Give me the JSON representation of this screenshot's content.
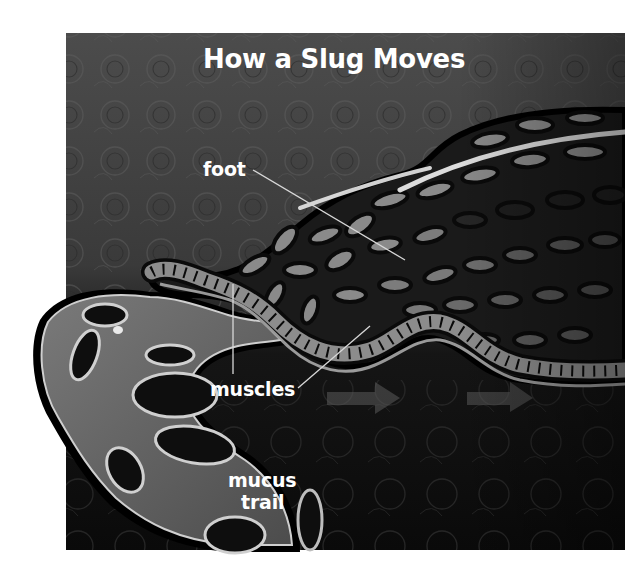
{
  "diagram": {
    "title": "How a Slug Moves",
    "labels": {
      "foot": "foot",
      "muscles": "muscles",
      "mucus_line1": "mucus",
      "mucus_line2": "trail"
    },
    "arrows": [
      {
        "direction": "right",
        "meaning": "direction-of-motion"
      },
      {
        "direction": "right",
        "meaning": "direction-of-motion"
      }
    ],
    "colors": {
      "background_top": "#4a4a4a",
      "background_bottom": "#0c0c0c",
      "body": "#1c1c1c",
      "cells_light": "#8a8a8a",
      "cells_dark": "#141414",
      "highlight": "#e8e8e8",
      "label_text": "#ffffff",
      "leader_line": "#d8d8d8"
    }
  }
}
